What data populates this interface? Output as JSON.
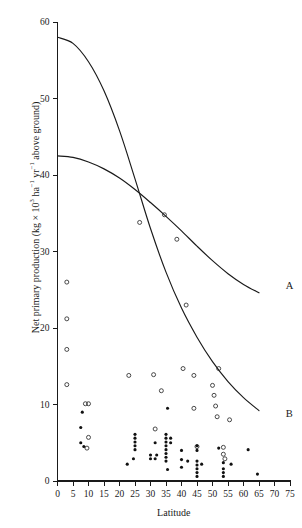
{
  "figure": {
    "background_color": "#ffffff",
    "ink_color": "#1a1a1a"
  },
  "axis": {
    "y_label_prefix": "Net primary production (kg × 10",
    "y_label_exp1": "3",
    "y_label_mid": " ha",
    "y_label_exp2": "−1",
    "y_label_mid2": " yr",
    "y_label_exp3": "−1",
    "y_label_suffix": " above ground)",
    "x_label": "Latitude",
    "x_ticks": [
      "0",
      "5",
      "10",
      "15",
      "20",
      "25",
      "30",
      "35",
      "40",
      "45",
      "50",
      "55",
      "60",
      "65",
      "70",
      "75"
    ],
    "y_ticks": [
      "0",
      "10",
      "20",
      "30",
      "40",
      "50",
      "60"
    ]
  },
  "curve_labels": {
    "a": "A",
    "b": "B"
  },
  "chart_data": {
    "type": "scatter",
    "title": "",
    "xlabel": "Latitude",
    "ylabel": "Net primary production (kg × 10^3 ha^-1 yr^-1 above ground)",
    "xlim": [
      0,
      75
    ],
    "ylim": [
      0,
      60
    ],
    "xticks": [
      0,
      5,
      10,
      15,
      20,
      25,
      30,
      35,
      40,
      45,
      50,
      55,
      60,
      65,
      70,
      75
    ],
    "yticks": [
      0,
      10,
      20,
      30,
      40,
      50,
      60
    ],
    "grid": false,
    "legend_position": "inline-curve-labels",
    "annotations": [
      {
        "text": "A",
        "x": 72.5,
        "y": 25.6
      },
      {
        "text": "B",
        "x": 72.5,
        "y": 8.9
      }
    ],
    "series": [
      {
        "name": "A",
        "type": "line",
        "marker": "none",
        "comment": "upper-left-to-right gently declining fitted curve, labelled A",
        "points": [
          {
            "x": 0,
            "y": 42.5
          },
          {
            "x": 5,
            "y": 42.3
          },
          {
            "x": 10,
            "y": 41.7
          },
          {
            "x": 15,
            "y": 40.8
          },
          {
            "x": 20,
            "y": 39.6
          },
          {
            "x": 25,
            "y": 38.1
          },
          {
            "x": 30,
            "y": 36.4
          },
          {
            "x": 35,
            "y": 34.6
          },
          {
            "x": 40,
            "y": 32.7
          },
          {
            "x": 45,
            "y": 30.7
          },
          {
            "x": 50,
            "y": 28.8
          },
          {
            "x": 55,
            "y": 27.1
          },
          {
            "x": 60,
            "y": 25.7
          },
          {
            "x": 65,
            "y": 24.6
          }
        ]
      },
      {
        "name": "B",
        "type": "line",
        "marker": "none",
        "comment": "steeply declining fitted curve starting near 58, labelled B",
        "points": [
          {
            "x": 0,
            "y": 58.0
          },
          {
            "x": 5,
            "y": 57.2
          },
          {
            "x": 10,
            "y": 54.8
          },
          {
            "x": 15,
            "y": 51.0
          },
          {
            "x": 20,
            "y": 45.8
          },
          {
            "x": 25,
            "y": 39.5
          },
          {
            "x": 30,
            "y": 33.0
          },
          {
            "x": 35,
            "y": 27.3
          },
          {
            "x": 40,
            "y": 22.6
          },
          {
            "x": 45,
            "y": 18.8
          },
          {
            "x": 50,
            "y": 15.6
          },
          {
            "x": 55,
            "y": 13.0
          },
          {
            "x": 60,
            "y": 10.9
          },
          {
            "x": 65,
            "y": 9.2
          }
        ]
      },
      {
        "name": "open-circle observations",
        "type": "scatter",
        "marker": "open-circle",
        "points": [
          {
            "x": 3.0,
            "y": 26.0
          },
          {
            "x": 3.0,
            "y": 21.2
          },
          {
            "x": 3.0,
            "y": 17.2
          },
          {
            "x": 3.0,
            "y": 12.6
          },
          {
            "x": 9.0,
            "y": 10.1
          },
          {
            "x": 10.0,
            "y": 10.1
          },
          {
            "x": 10.0,
            "y": 5.7
          },
          {
            "x": 9.5,
            "y": 4.3
          },
          {
            "x": 23.0,
            "y": 13.8
          },
          {
            "x": 26.5,
            "y": 33.8
          },
          {
            "x": 31.0,
            "y": 13.9
          },
          {
            "x": 31.5,
            "y": 6.8
          },
          {
            "x": 33.5,
            "y": 11.8
          },
          {
            "x": 34.5,
            "y": 34.8
          },
          {
            "x": 38.5,
            "y": 31.6
          },
          {
            "x": 40.5,
            "y": 14.7
          },
          {
            "x": 41.5,
            "y": 23.0
          },
          {
            "x": 44.0,
            "y": 13.8
          },
          {
            "x": 44.0,
            "y": 9.5
          },
          {
            "x": 45.0,
            "y": 4.5
          },
          {
            "x": 50.0,
            "y": 12.5
          },
          {
            "x": 50.5,
            "y": 11.2
          },
          {
            "x": 51.0,
            "y": 9.8
          },
          {
            "x": 51.5,
            "y": 8.4
          },
          {
            "x": 52.0,
            "y": 14.7
          },
          {
            "x": 53.5,
            "y": 4.4
          },
          {
            "x": 53.5,
            "y": 3.5
          },
          {
            "x": 54.0,
            "y": 2.9
          },
          {
            "x": 55.5,
            "y": 8.0
          }
        ]
      },
      {
        "name": "filled-circle observations",
        "type": "scatter",
        "marker": "filled-circle",
        "points": [
          {
            "x": 8.0,
            "y": 9.0
          },
          {
            "x": 7.5,
            "y": 7.0
          },
          {
            "x": 7.5,
            "y": 5.0
          },
          {
            "x": 8.5,
            "y": 4.5
          },
          {
            "x": 22.5,
            "y": 2.2
          },
          {
            "x": 25.0,
            "y": 6.1
          },
          {
            "x": 25.0,
            "y": 5.6
          },
          {
            "x": 25.0,
            "y": 5.1
          },
          {
            "x": 25.0,
            "y": 4.6
          },
          {
            "x": 25.0,
            "y": 4.1
          },
          {
            "x": 24.5,
            "y": 2.9
          },
          {
            "x": 30.0,
            "y": 3.4
          },
          {
            "x": 30.0,
            "y": 2.9
          },
          {
            "x": 31.5,
            "y": 5.0
          },
          {
            "x": 31.5,
            "y": 2.9
          },
          {
            "x": 32.0,
            "y": 3.4
          },
          {
            "x": 35.0,
            "y": 6.1
          },
          {
            "x": 35.0,
            "y": 5.6
          },
          {
            "x": 35.0,
            "y": 5.1
          },
          {
            "x": 35.0,
            "y": 4.6
          },
          {
            "x": 35.0,
            "y": 4.1
          },
          {
            "x": 35.0,
            "y": 3.6
          },
          {
            "x": 35.0,
            "y": 3.1
          },
          {
            "x": 35.0,
            "y": 2.6
          },
          {
            "x": 35.5,
            "y": 9.5
          },
          {
            "x": 35.5,
            "y": 1.5
          },
          {
            "x": 36.5,
            "y": 5.6
          },
          {
            "x": 36.5,
            "y": 5.0
          },
          {
            "x": 40.0,
            "y": 4.0
          },
          {
            "x": 40.0,
            "y": 2.8
          },
          {
            "x": 40.0,
            "y": 1.8
          },
          {
            "x": 42.0,
            "y": 2.6
          },
          {
            "x": 45.0,
            "y": 4.6
          },
          {
            "x": 45.0,
            "y": 4.0
          },
          {
            "x": 45.0,
            "y": 2.6
          },
          {
            "x": 45.0,
            "y": 2.1
          },
          {
            "x": 45.0,
            "y": 1.6
          },
          {
            "x": 45.0,
            "y": 1.1
          },
          {
            "x": 45.0,
            "y": 0.6
          },
          {
            "x": 46.5,
            "y": 2.2
          },
          {
            "x": 52.0,
            "y": 4.3
          },
          {
            "x": 53.5,
            "y": 2.4
          },
          {
            "x": 53.5,
            "y": 1.6
          },
          {
            "x": 53.5,
            "y": 1.1
          },
          {
            "x": 53.5,
            "y": 0.6
          },
          {
            "x": 56.0,
            "y": 2.2
          },
          {
            "x": 61.5,
            "y": 4.1
          },
          {
            "x": 64.5,
            "y": 0.9
          }
        ]
      }
    ]
  }
}
